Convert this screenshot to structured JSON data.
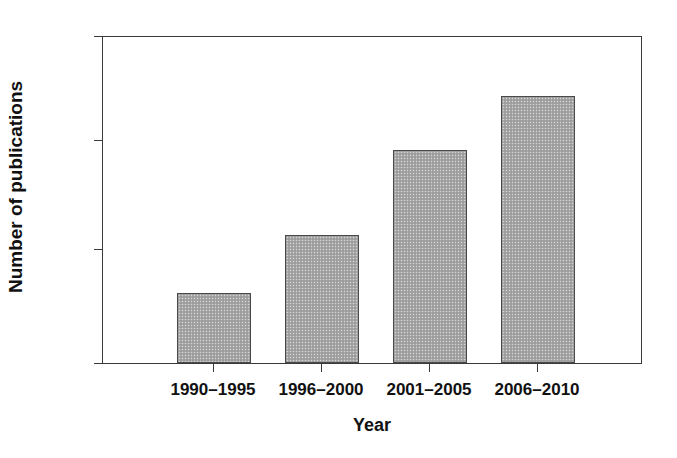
{
  "chart_data": {
    "type": "bar",
    "title": "",
    "subtitle": "",
    "xlabel": "Year",
    "ylabel": "Number of publications",
    "categories": [
      "1990–1995",
      "1996–2000",
      "2001–2005",
      "2006–2010"
    ],
    "values": [
      32,
      59,
      98,
      123
    ],
    "series": [
      {
        "name": "Number of publications",
        "values": [
          32,
          59,
          98,
          123
        ]
      }
    ],
    "ylim": [
      0,
      150
    ],
    "yticks": [
      0,
      50,
      100,
      150
    ],
    "ytick_labels": [
      "0",
      "50",
      "100",
      "150"
    ],
    "grid": false,
    "legend": false,
    "legend_position": "none",
    "bar_fill_color": "#a8a8a8",
    "bar_edge_color": "#4a4a4a",
    "axis_color": "#3a3a3a",
    "background_color": "#ffffff",
    "text_color": "#111111",
    "annotations": []
  },
  "axes": {
    "y": {
      "title": "Number of publications",
      "ticks": [
        {
          "label": "150",
          "value": 150
        },
        {
          "label": "100",
          "value": 100
        },
        {
          "label": "50",
          "value": 50
        },
        {
          "label": "0",
          "value": 0
        }
      ]
    },
    "x": {
      "title": "Year",
      "ticks": [
        {
          "label": "1990–1995"
        },
        {
          "label": "1996–2000"
        },
        {
          "label": "2001–2005"
        },
        {
          "label": "2006–2010"
        }
      ]
    }
  }
}
